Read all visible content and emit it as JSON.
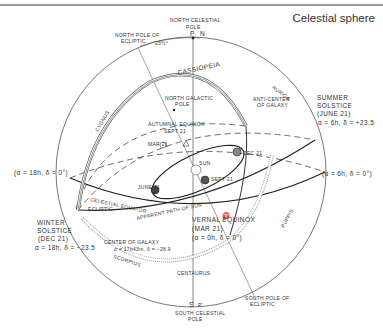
{
  "header": {
    "title": "Celestial sphere"
  },
  "poles": {
    "north_celestial_line1": "NORTH CELESTIAL",
    "north_celestial_line2": "POLE",
    "north_p": "P",
    "north_n": "N",
    "north_ecliptic_line1": "NORTH POLE OF",
    "north_ecliptic_line2": "ECLIPTIC",
    "obliquity": "23½°",
    "north_galactic_line1": "NORTH GALACTIC",
    "north_galactic_line2": "POLE",
    "south_s": "S",
    "south_p": "P'",
    "south_celestial_line1": "SOUTH CELESTIAL",
    "south_celestial_line2": "POLE",
    "south_ecliptic_line1": "SOUTH POLE OF",
    "south_ecliptic_line2": "ECLIPTIC"
  },
  "constellations": {
    "cassiopeia": "CASSIOPEIA",
    "auriga": "AURIGA",
    "cygnus": "CYGNUS",
    "puppis": "PUPPIS",
    "scorpius": "SCORPIUS",
    "centaurus": "CENTAURUS"
  },
  "points": {
    "anticenter_line1": "ANTI-CENTER",
    "anticenter_line2": "OF GALAXY",
    "summer_line1": "SUMMER",
    "summer_line2": "SOLSTICE",
    "summer_line3": "(JUNE 21)",
    "summer_coords": "α = 6h, δ = +23.5",
    "autumnal_line1": "AUTUMNAL EQUINOX",
    "autumnal_line2": "SEPT 21",
    "left_coords": "(α = 18h, δ = 0°)",
    "right_coords": "(α = 6h, δ = 0°)",
    "winter_line1": "WINTER",
    "winter_line2": "SOLSTICE",
    "winter_line3": "(DEC 21)",
    "winter_coords": "α = 18h, δ = −23.5",
    "center_galaxy": "CENTER OF GALAXY",
    "center_galaxy_coords": "α = 17h43m, δ = −28.9",
    "vernal_line1": "VERNAL EQUINOX",
    "vernal_line2": "(MAR 21)",
    "vernal_coords": "(α = 0h, δ = 0°)",
    "vernal_symbol": "♈"
  },
  "circles": {
    "celestial_equator": "CELESTIAL EQUATOR",
    "ecliptic": "ECLIPTIC",
    "apparent_path": "APPARENT PATH OF SUN"
  },
  "orbit": {
    "sun": "SUN",
    "mar21": "MAR 21",
    "dec21": "DEC 21",
    "june21": "JUNE 21",
    "sept21": "SEPT 21"
  }
}
